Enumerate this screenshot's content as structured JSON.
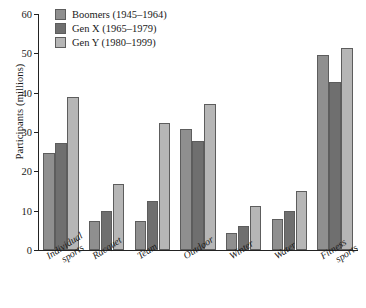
{
  "chart_data": {
    "type": "bar",
    "title": "",
    "xlabel": "",
    "ylabel": "Participants (millions)",
    "ylim": [
      0,
      60
    ],
    "yticks": [
      0,
      10,
      20,
      30,
      40,
      50,
      60
    ],
    "grid": false,
    "legend_position": "top-left",
    "categories": [
      "Individual sports",
      "Racquet",
      "Team",
      "Outdoor",
      "Winter",
      "Water",
      "Fitness sports"
    ],
    "category_lines": [
      [
        "Individual",
        "sports"
      ],
      [
        "Racquet",
        ""
      ],
      [
        "Team",
        ""
      ],
      [
        "Outdoor",
        ""
      ],
      [
        "Winter",
        ""
      ],
      [
        "Water",
        ""
      ],
      [
        "Fitness",
        "sports"
      ]
    ],
    "series": [
      {
        "name": "Boomers (1945–1964)",
        "color": "#8f8f8f",
        "values": [
          24.7,
          7.5,
          7.5,
          30.7,
          4.2,
          8.0,
          49.7
        ]
      },
      {
        "name": "Gen X (1965–1979)",
        "color": "#6f6f6f",
        "values": [
          27.2,
          10.0,
          12.4,
          27.8,
          6.0,
          9.8,
          42.8
        ]
      },
      {
        "name": "Gen Y (1980–1999)",
        "color": "#b6b6b6",
        "values": [
          39.0,
          16.8,
          32.3,
          37.0,
          11.3,
          14.9,
          51.3
        ]
      }
    ]
  }
}
